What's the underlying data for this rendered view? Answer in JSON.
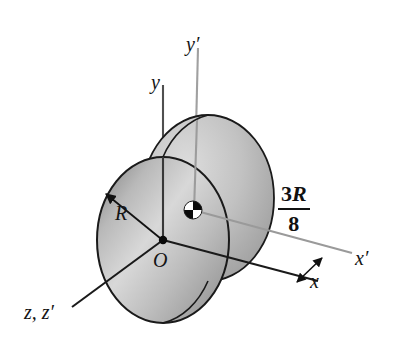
{
  "figure": {
    "labels": {
      "y_axis": "y",
      "y_prime_axis": "y′",
      "x_axis": "x",
      "x_prime_axis": "x′",
      "z_axes": "z, z′",
      "origin": "O",
      "radius": "R"
    },
    "dimension": {
      "numerator_coefficient": "3",
      "numerator_variable": "R",
      "denominator": "8",
      "text": "3R/8"
    },
    "colors": {
      "disk_fill_light": "#d9d9d9",
      "disk_fill_mid": "#b4b4b4",
      "disk_fill_dark": "#8e8e8e",
      "outline": "#1a1a1a",
      "axis_dark": "#4a4a4a",
      "axis_light": "#9a9a9a",
      "background": "#ffffff",
      "mass_center_dark": "#000000",
      "mass_center_light": "#ffffff"
    },
    "geometry": {
      "origin_point": "(163, 240)",
      "mass_center_point": "(193, 210)",
      "front_face_center": "(163, 240)",
      "back_face_center": "(208, 198)",
      "face_radius_x": "66",
      "face_radius_y": "83"
    },
    "icons": {
      "mass_center": "center-of-mass-icon",
      "origin": "origin-dot-icon"
    }
  }
}
